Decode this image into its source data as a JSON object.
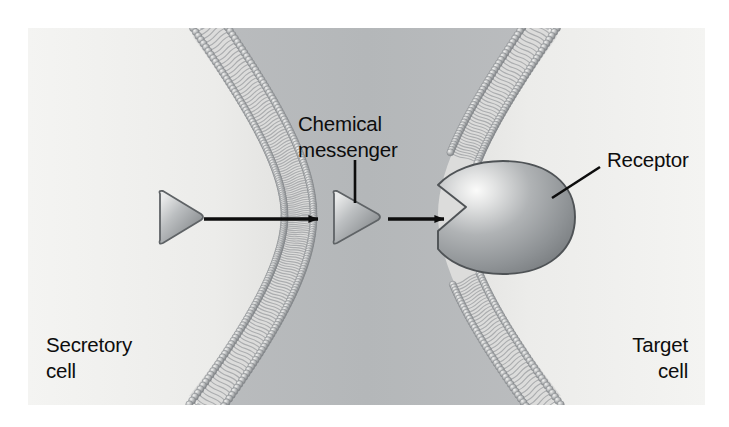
{
  "figure": {
    "background_color": "#ffffff",
    "panel_color": "#ececeb",
    "extracellular_color": "#b9bcbe",
    "cytoplasm_color": "#f0f0ee",
    "membrane_color": "#9a9c9e",
    "protein_color": "#9ea1a3",
    "ink_color": "#0d0d0d"
  },
  "labels": {
    "chemical_messenger": {
      "line1": "Chemical",
      "line2": "messenger"
    },
    "receptor": "Receptor",
    "secretory_cell": {
      "line1": "Secretory",
      "line2": "cell"
    },
    "target_cell": {
      "line1": "Target",
      "line2": "cell"
    }
  },
  "elements": {
    "secretory_membrane": "phospholipid-bilayer",
    "target_membrane": "phospholipid-bilayer",
    "messenger_inside": "triangle-messenger",
    "messenger_outside": "triangle-messenger",
    "receptor_protein": "notched-receptor",
    "arrow_secretion": "arrow-right",
    "arrow_binding": "arrow-right",
    "leader_messenger": "leader-line",
    "leader_receptor": "leader-line"
  }
}
